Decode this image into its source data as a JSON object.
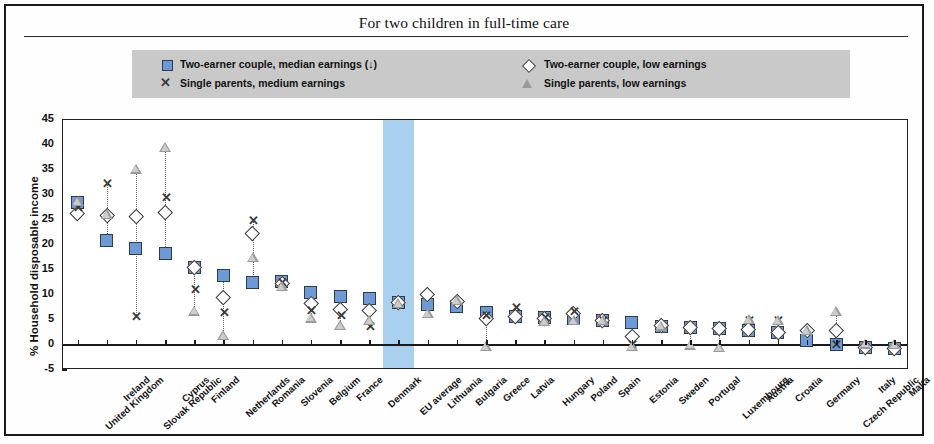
{
  "chart_title": "For two children in full-time care",
  "legend": {
    "items": [
      {
        "marker": "square",
        "label": "Two-earner couple, median earnings (↓)"
      },
      {
        "marker": "diamond",
        "label": "Two-earner couple, low earnings"
      },
      {
        "marker": "cross",
        "label": "Single parents, medium  earnings"
      },
      {
        "marker": "triangle",
        "label": "Single parents, low earnings"
      }
    ],
    "background_color": "#c9c9c9"
  },
  "colors": {
    "square_fill": "#6d9ad6",
    "square_stroke": "#2f3a4a",
    "triangle_fill": "#9a9a9a",
    "diamond_fill": "#ffffff",
    "eu_band": "#a5cdee",
    "axis": "#1a1a1a"
  },
  "chart_data": {
    "type": "scatter",
    "title": "For two children in full-time care",
    "xlabel": "",
    "ylabel": "% Household disposable income",
    "ylim": [
      -5,
      45
    ],
    "yticks": [
      -5,
      0,
      5,
      10,
      15,
      20,
      25,
      30,
      35,
      40,
      45
    ],
    "grid": false,
    "legend_position": "top",
    "highlight_category": "EU average",
    "categories": [
      "United Kingdom",
      "Ireland",
      "Slovak Republic",
      "Cyprus",
      "Finland",
      "Netherlands",
      "Romania",
      "Slovenia",
      "Belgium",
      "France",
      "Denmark",
      "EU average",
      "Lithuania",
      "Bulgaria",
      "Greece",
      "Latvia",
      "Hungary",
      "Poland",
      "Spain",
      "Estonia",
      "Sweden",
      "Portugal",
      "Luxembourg",
      "Austria",
      "Croatia",
      "Germany",
      "Czech Republic",
      "Italy",
      "Malta"
    ],
    "series": [
      {
        "name": "Two-earner couple, median earnings (↓)",
        "marker": "square",
        "values": [
          28.5,
          21.0,
          19.3,
          18.4,
          15.5,
          14.0,
          12.5,
          12.7,
          10.5,
          9.8,
          9.3,
          8.5,
          8.2,
          7.8,
          6.6,
          5.8,
          5.5,
          5.4,
          5.0,
          4.5,
          3.8,
          3.6,
          3.4,
          3.0,
          2.6,
          1.0,
          0.2,
          -0.4,
          -0.6
        ]
      },
      {
        "name": "Two-earner couple, low earnings",
        "marker": "diamond",
        "values": [
          26.3,
          26.0,
          25.8,
          26.5,
          15.6,
          9.6,
          22.3,
          12.4,
          8.4,
          7.1,
          7.0,
          8.6,
          10.2,
          8.8,
          5.4,
          5.8,
          5.4,
          6.4,
          4.9,
          1.8,
          3.9,
          3.6,
          3.4,
          3.2,
          2.6,
          2.9,
          3.0,
          -0.4,
          -0.6
        ]
      },
      {
        "name": "Single parents, medium  earnings",
        "marker": "cross",
        "values": [
          27.6,
          32.3,
          5.7,
          29.6,
          11.1,
          6.6,
          25.0,
          12.5,
          7.0,
          6.0,
          3.8,
          null,
          null,
          null,
          6.0,
          7.6,
          5.6,
          6.8,
          5.0,
          0.2,
          null,
          null,
          null,
          5.0,
          5.0,
          null,
          0.1,
          null,
          null
        ]
      },
      {
        "name": "Single parents, low earnings",
        "marker": "triangle",
        "values": [
          28.8,
          26.2,
          35.3,
          39.6,
          6.9,
          2.0,
          17.6,
          11.8,
          5.5,
          4.0,
          5.0,
          8.4,
          6.4,
          9.0,
          -0.2,
          null,
          4.8,
          5.0,
          5.0,
          -0.2,
          3.9,
          0.1,
          -0.4,
          5.2,
          5.0,
          3.0,
          6.8,
          0.3,
          0.2
        ]
      }
    ]
  }
}
